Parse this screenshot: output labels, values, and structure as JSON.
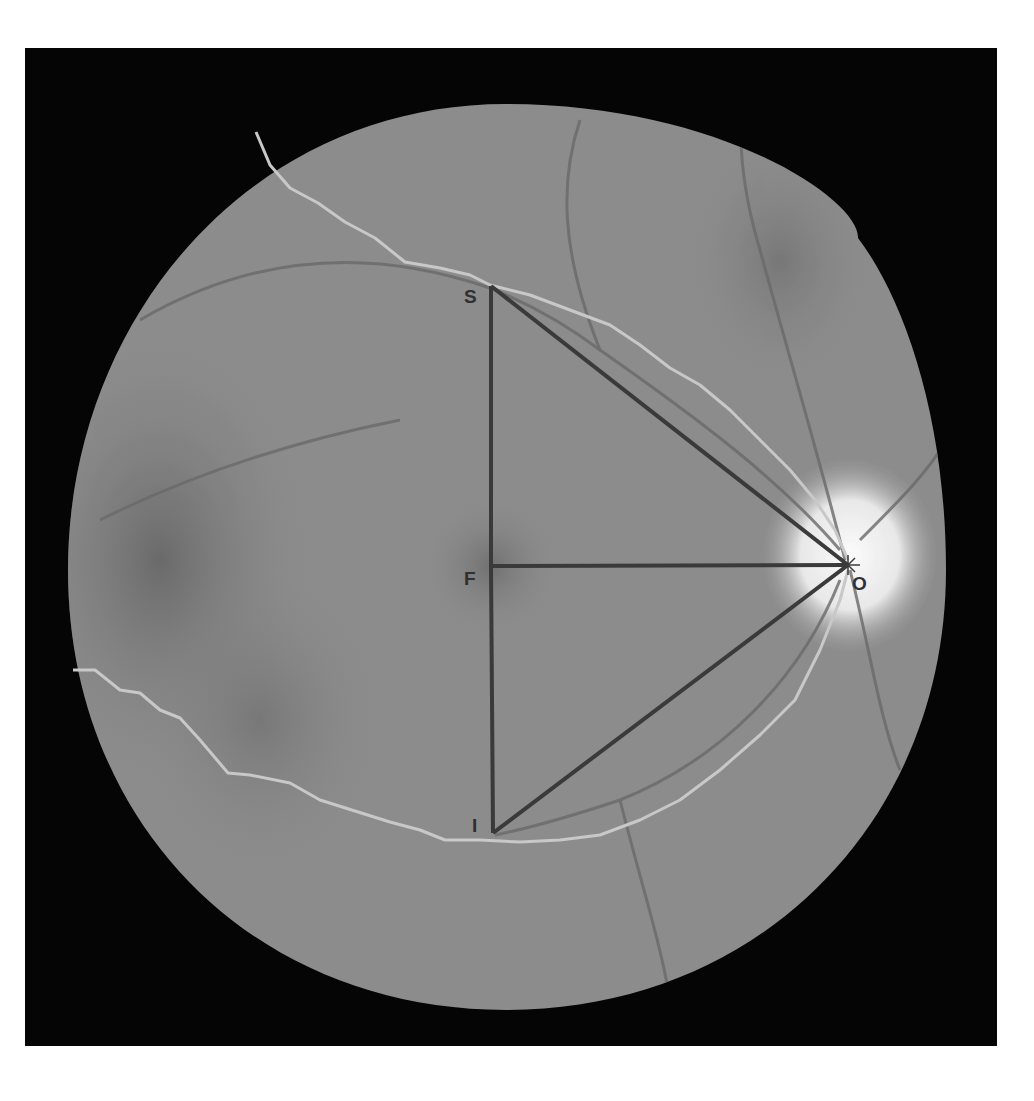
{
  "figure": {
    "background_color": "#050505",
    "fundus_color": "#8a8a8a",
    "line_color": "#3a3a3a",
    "trace_color": "#c8c8c8",
    "optic_disc_color": "#f2f2f2"
  },
  "landmarks": [
    {
      "id": "S",
      "label": "S",
      "x": 491,
      "y": 286
    },
    {
      "id": "F",
      "label": "F",
      "x": 491,
      "y": 566
    },
    {
      "id": "I",
      "label": "I",
      "x": 493,
      "y": 833
    },
    {
      "id": "O",
      "label": "O",
      "x": 848,
      "y": 565
    }
  ],
  "segments": [
    [
      "S",
      "F"
    ],
    [
      "F",
      "I"
    ],
    [
      "F",
      "O"
    ],
    [
      "S",
      "O"
    ],
    [
      "I",
      "O"
    ]
  ],
  "labels": {
    "S": "S",
    "F": "F",
    "I": "I",
    "O": "O"
  }
}
